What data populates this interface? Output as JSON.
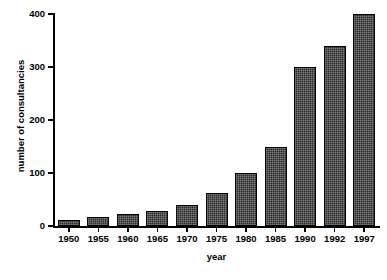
{
  "chart_data": {
    "type": "bar",
    "title": "",
    "subtitle": "",
    "xlabel": "year",
    "ylabel": "number of consultancies",
    "categories": [
      "1950",
      "1955",
      "1960",
      "1965",
      "1970",
      "1975",
      "1980",
      "1985",
      "1990",
      "1992",
      "1997"
    ],
    "values": [
      12,
      17,
      22,
      28,
      40,
      62,
      100,
      150,
      300,
      340,
      400
    ],
    "ylim": [
      0,
      400
    ],
    "yticks": [
      "0",
      "100",
      "200",
      "300",
      "400"
    ],
    "ytick_values": [
      0,
      100,
      200,
      300,
      400
    ],
    "grid": false,
    "legend": false,
    "legend_position": "none",
    "bar_color": "#2b2b2b",
    "bar_edge_color": "#000000",
    "axis_color": "#000000",
    "background_color": "#ffffff"
  }
}
